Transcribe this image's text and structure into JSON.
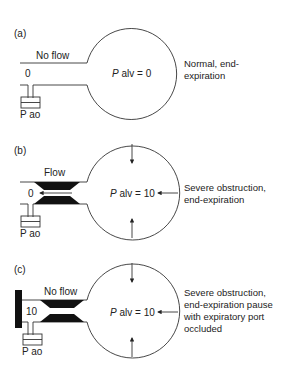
{
  "panels": [
    {
      "id": "a",
      "label": "(a)",
      "flow_label": "No flow",
      "airway_pressure": "0",
      "gauge_label": "P ao",
      "alveolar_var": "P",
      "alveolar_text": " alv = 0",
      "description": [
        "Normal, end-",
        "expiration"
      ],
      "obstruction": false,
      "occluded": false,
      "recoil_arrows": false
    },
    {
      "id": "b",
      "label": "(b)",
      "flow_label": "Flow",
      "airway_pressure": "0",
      "gauge_label": "P ao",
      "alveolar_var": "P",
      "alveolar_text": " alv = 10",
      "description": [
        "Severe obstruction,",
        "end-expiration"
      ],
      "obstruction": true,
      "occluded": false,
      "recoil_arrows": true
    },
    {
      "id": "c",
      "label": "(c)",
      "flow_label": "No flow",
      "airway_pressure": "10",
      "gauge_label": "P ao",
      "alveolar_var": "P",
      "alveolar_text": " alv = 10",
      "description": [
        "Severe obstruction,",
        "end-expiration pause",
        "with expiratory port",
        "occluded"
      ],
      "obstruction": true,
      "occluded": true,
      "recoil_arrows": true
    }
  ]
}
